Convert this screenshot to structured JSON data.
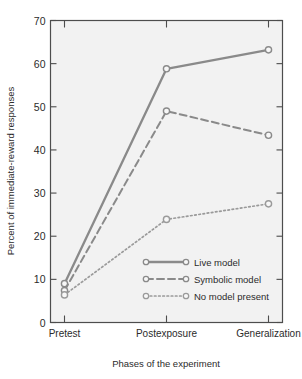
{
  "chart_data": {
    "type": "line",
    "title": "",
    "subtitle": "",
    "xlabel": "Phases of the experiment",
    "ylabel": "Percent of immediate-reward responses",
    "categories": [
      "Pretest",
      "Postexposure",
      "Generalization"
    ],
    "xtick_labels": [
      "Pretest",
      "Postexposure",
      "Generalization"
    ],
    "ytick_labels": [
      "0",
      "10",
      "20",
      "30",
      "40",
      "50",
      "60",
      "70"
    ],
    "ytick_values": [
      0,
      10,
      20,
      30,
      40,
      50,
      60,
      70
    ],
    "ylim": [
      0,
      70
    ],
    "grid": false,
    "legend_position": "lower-right-inside",
    "marker": "open-circle",
    "series": [
      {
        "name": "Live model",
        "legend_label": "Live model",
        "linestyle": "solid",
        "color": "#8a8a8a",
        "values": [
          9.0,
          58.8,
          63.2
        ]
      },
      {
        "name": "Symbolic model",
        "legend_label": "Symbolic model",
        "linestyle": "dashed",
        "color": "#8a8a8a",
        "values": [
          7.4,
          49.0,
          43.4
        ]
      },
      {
        "name": "No model present",
        "legend_label": "No model present",
        "linestyle": "dotted",
        "color": "#9a9a9a",
        "values": [
          6.4,
          23.9,
          27.5
        ]
      }
    ]
  },
  "figure": {
    "background_color": "#ffffff",
    "plot_background_color": "#f2f2f2",
    "axis_color": "#4d4d4d",
    "text_color": "#2b2b2b"
  },
  "legend": {
    "entries": [
      {
        "label": "Live model",
        "style": "solid"
      },
      {
        "label": "Symbolic model",
        "style": "dashed"
      },
      {
        "label": "No model present",
        "style": "dotted"
      }
    ]
  }
}
